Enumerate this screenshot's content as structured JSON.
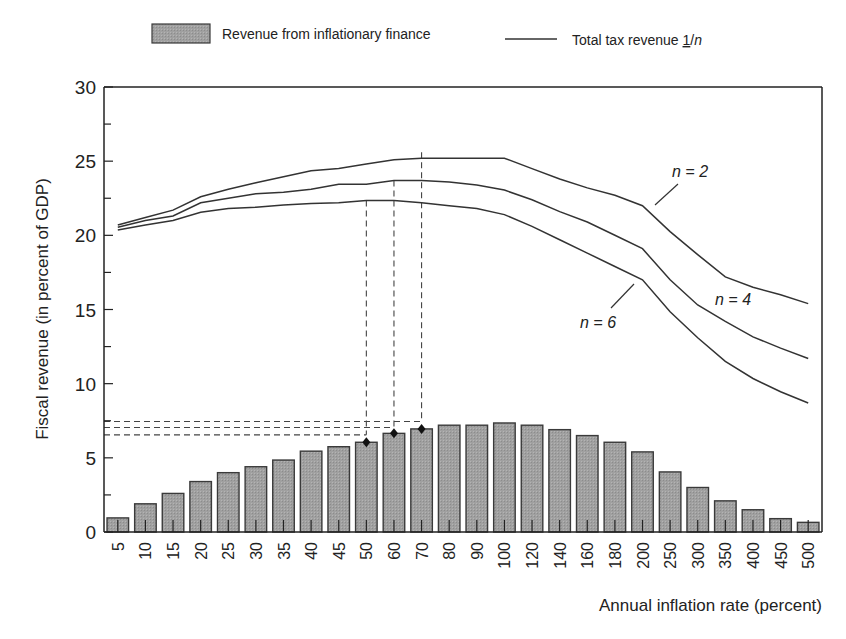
{
  "chart_data": {
    "type": "bar+line",
    "title": "",
    "xlabel": "Annual inflation rate (percent)",
    "ylabel": "Fiscal revenue (in percent of GDP)",
    "ylim": [
      0,
      30
    ],
    "yticks": [
      0,
      5,
      10,
      15,
      20,
      25,
      30
    ],
    "grid": false,
    "legend_position": "top",
    "legend": [
      {
        "label": "Revenue from inflationary finance",
        "kind": "bar"
      },
      {
        "label_prefix": "Total tax revenue ",
        "label_underlined": "1",
        "label_suffix": "/n",
        "kind": "line"
      }
    ],
    "categories": [
      "5",
      "10",
      "15",
      "20",
      "25",
      "30",
      "35",
      "40",
      "45",
      "50",
      "60",
      "70",
      "80",
      "90",
      "100",
      "120",
      "140",
      "160",
      "180",
      "200",
      "250",
      "300",
      "350",
      "400",
      "450",
      "500"
    ],
    "bars": {
      "name": "Revenue from inflationary finance",
      "values": [
        0.95,
        1.9,
        2.6,
        3.4,
        4.0,
        4.4,
        4.85,
        5.45,
        5.75,
        6.05,
        6.65,
        6.95,
        7.2,
        7.2,
        7.35,
        7.2,
        6.9,
        6.5,
        6.05,
        5.4,
        4.05,
        3.0,
        2.1,
        1.5,
        0.9,
        0.65
      ]
    },
    "series": [
      {
        "name": "n = 2",
        "values": [
          20.7,
          21.2,
          21.7,
          22.6,
          23.1,
          23.55,
          23.95,
          24.35,
          24.5,
          24.8,
          25.1,
          25.2,
          25.2,
          25.2,
          25.2,
          24.5,
          23.8,
          23.2,
          22.7,
          22.0,
          20.25,
          18.7,
          17.2,
          16.5,
          16.0,
          15.4
        ]
      },
      {
        "name": "n = 4",
        "values": [
          20.55,
          21.0,
          21.3,
          22.2,
          22.5,
          22.8,
          22.9,
          23.1,
          23.45,
          23.45,
          23.7,
          23.7,
          23.6,
          23.4,
          23.05,
          22.4,
          21.6,
          20.9,
          20.0,
          19.1,
          17.0,
          15.3,
          14.2,
          13.15,
          12.4,
          11.7
        ]
      },
      {
        "name": "n = 6",
        "values": [
          20.35,
          20.7,
          21.0,
          21.55,
          21.8,
          21.9,
          22.05,
          22.15,
          22.2,
          22.35,
          22.35,
          22.2,
          22.0,
          21.8,
          21.4,
          20.6,
          19.7,
          18.8,
          17.9,
          17.0,
          14.85,
          13.1,
          11.5,
          10.35,
          9.45,
          8.7
        ]
      }
    ],
    "annotations": [
      {
        "text": "n = 2",
        "series": "n = 2"
      },
      {
        "text": "n = 4",
        "series": "n = 4"
      },
      {
        "text": "n = 6",
        "series": "n = 6"
      }
    ],
    "reference_markers": [
      {
        "category": "50",
        "bar_value": 6.05,
        "line": "n = 6",
        "line_peak": 22.35,
        "hline_value": 6.55
      },
      {
        "category": "60",
        "bar_value": 6.65,
        "line": "n = 4",
        "line_peak": 23.7,
        "hline_value": 7.05
      },
      {
        "category": "70",
        "bar_value": 6.95,
        "line": "n = 2",
        "line_peak": 25.2,
        "hline_value": 7.45
      }
    ]
  },
  "colors": {
    "bar_fill": "#9a9a9a",
    "bar_stroke": "#3a3a3a",
    "line": "#333333",
    "axis": "#222222",
    "dashed": "#444444",
    "marker": "#111111"
  }
}
